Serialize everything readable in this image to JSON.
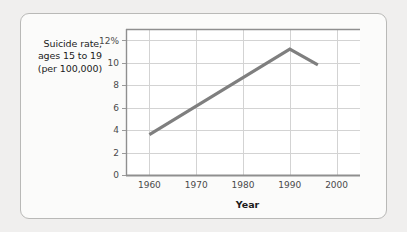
{
  "chart_data": {
    "type": "line",
    "title": "",
    "subtitle": "",
    "xlabel": "Year",
    "ylabel": "Suicide rate, ages 15 to 19 (per 100,000)",
    "ylabel_lines": [
      "Suicide rate,",
      "ages 15 to 19",
      "(per 100,000)"
    ],
    "xlim": [
      1955,
      2005
    ],
    "ylim": [
      0,
      13
    ],
    "grid": true,
    "legend": "none",
    "line_color": "#7f7f7f",
    "x_tick_labels": [
      "1960",
      "1970",
      "1980",
      "1990",
      "2000"
    ],
    "x_ticks": [
      1960,
      1970,
      1980,
      1990,
      2000
    ],
    "y_tick_labels": [
      "0",
      "2",
      "4",
      "6",
      "8",
      "10",
      "12%"
    ],
    "y_ticks": [
      0,
      2,
      4,
      6,
      8,
      10,
      12
    ],
    "x": [
      1960,
      1990,
      1996
    ],
    "values": [
      3.6,
      11.2,
      9.8
    ],
    "series": [
      {
        "name": "Suicide rate, ages 15 to 19 (per 100,000)",
        "color": "#7f7f7f",
        "points": [
          {
            "x": 1960,
            "y": 3.6
          },
          {
            "x": 1990,
            "y": 11.2
          },
          {
            "x": 1996,
            "y": 9.8
          }
        ]
      }
    ]
  },
  "figure": {
    "background_color": "#fbfbfa",
    "border_color": "#b9b9b7",
    "page_background": "#f0efee"
  }
}
